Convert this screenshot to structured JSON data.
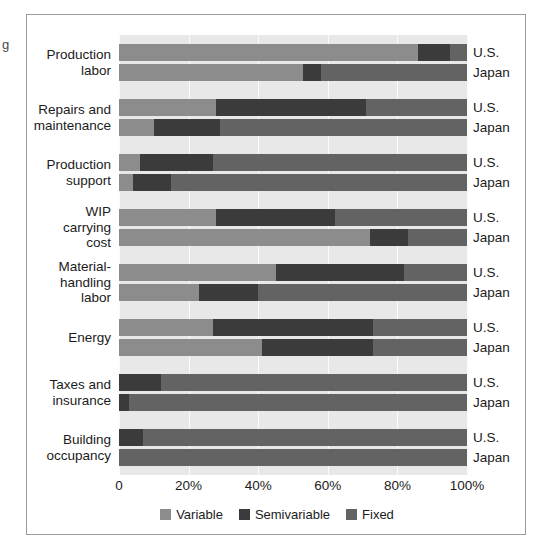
{
  "edge_fragment": "g",
  "legend": {
    "position": "bottom-center",
    "items": [
      {
        "label": "Variable",
        "color": "#8c8c8c"
      },
      {
        "label": "Semivariable",
        "color": "#3b3b3b"
      },
      {
        "label": "Fixed",
        "color": "#636363"
      }
    ]
  },
  "axis": {
    "ticks": [
      "0",
      "20%",
      "40%",
      "60%",
      "80%",
      "100%"
    ],
    "tick_values": [
      0,
      20,
      40,
      60,
      80,
      100
    ]
  },
  "series_names": [
    "U.S.",
    "Japan"
  ],
  "chart_data": {
    "type": "bar",
    "orientation": "horizontal",
    "stacked": true,
    "normalized_percent": true,
    "title": "",
    "xlabel": "",
    "ylabel": "",
    "xlim": [
      0,
      100
    ],
    "grid": true,
    "legend_position": "bottom-center",
    "categories": [
      "Production labor",
      "Repairs and maintenance",
      "Production support",
      "WIP carrying cost",
      "Material-handling labor",
      "Energy",
      "Taxes and insurance",
      "Building occupancy"
    ],
    "series": [
      {
        "name": "Variable",
        "color": "#8c8c8c"
      },
      {
        "name": "Semivariable",
        "color": "#3b3b3b"
      },
      {
        "name": "Fixed",
        "color": "#636363"
      }
    ],
    "groups": [
      {
        "category": "Production labor",
        "label_lines": "Production\nlabor",
        "rows": [
          {
            "country": "U.S.",
            "variable": 86,
            "semivariable": 9,
            "fixed": 5
          },
          {
            "country": "Japan",
            "variable": 53,
            "semivariable": 5,
            "fixed": 42
          }
        ]
      },
      {
        "category": "Repairs and maintenance",
        "label_lines": "Repairs and\nmaintenance",
        "rows": [
          {
            "country": "U.S.",
            "variable": 28,
            "semivariable": 43,
            "fixed": 29
          },
          {
            "country": "Japan",
            "variable": 10,
            "semivariable": 19,
            "fixed": 71
          }
        ]
      },
      {
        "category": "Production support",
        "label_lines": "Production\nsupport",
        "rows": [
          {
            "country": "U.S.",
            "variable": 6,
            "semivariable": 21,
            "fixed": 73
          },
          {
            "country": "Japan",
            "variable": 4,
            "semivariable": 11,
            "fixed": 85
          }
        ]
      },
      {
        "category": "WIP carrying cost",
        "label_lines": "WIP\ncarrying\ncost",
        "rows": [
          {
            "country": "U.S.",
            "variable": 28,
            "semivariable": 34,
            "fixed": 38
          },
          {
            "country": "Japan",
            "variable": 72,
            "semivariable": 11,
            "fixed": 17
          }
        ]
      },
      {
        "category": "Material-handling labor",
        "label_lines": "Material-\nhandling\nlabor",
        "rows": [
          {
            "country": "U.S.",
            "variable": 45,
            "semivariable": 37,
            "fixed": 18
          },
          {
            "country": "Japan",
            "variable": 23,
            "semivariable": 17,
            "fixed": 60
          }
        ]
      },
      {
        "category": "Energy",
        "label_lines": "Energy",
        "rows": [
          {
            "country": "U.S.",
            "variable": 27,
            "semivariable": 46,
            "fixed": 27
          },
          {
            "country": "Japan",
            "variable": 41,
            "semivariable": 32,
            "fixed": 27
          }
        ]
      },
      {
        "category": "Taxes and insurance",
        "label_lines": "Taxes and\ninsurance",
        "rows": [
          {
            "country": "U.S.",
            "variable": 0,
            "semivariable": 12,
            "fixed": 88
          },
          {
            "country": "Japan",
            "variable": 0,
            "semivariable": 3,
            "fixed": 97
          }
        ]
      },
      {
        "category": "Building occupancy",
        "label_lines": "Building\noccupancy",
        "rows": [
          {
            "country": "U.S.",
            "variable": 0,
            "semivariable": 7,
            "fixed": 93
          },
          {
            "country": "Japan",
            "variable": 0,
            "semivariable": 0,
            "fixed": 100
          }
        ]
      }
    ]
  }
}
